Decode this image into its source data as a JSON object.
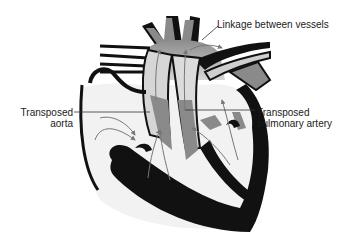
{
  "diagram": {
    "labels": {
      "linkage": "Linkage between vessels",
      "aorta_line1": "Transposed",
      "aorta_line2": "aorta",
      "pulmonary_line1": "Transposed",
      "pulmonary_line2": "pulmonary artery"
    },
    "colors": {
      "wall": "#111111",
      "chamber": "#f2f2f2",
      "vessel_light": "#e0e0e0",
      "vessel_dark": "#8a8a8a",
      "arrow": "#777777",
      "leader": "#333333"
    }
  }
}
